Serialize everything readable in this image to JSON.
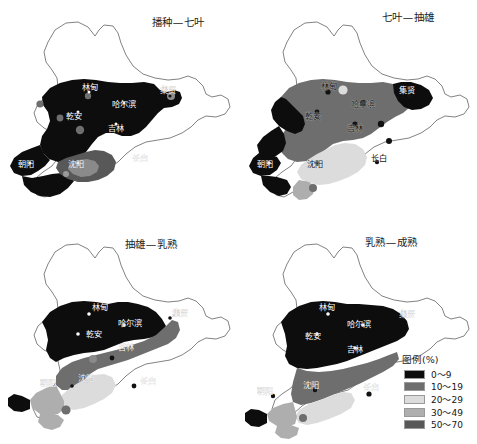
{
  "figure": {
    "kind": "choropleth-map-grid",
    "region": "Northeast China",
    "grid": "2x2"
  },
  "panels": [
    {
      "id": "panel-sowing-seven-leaf",
      "title": "播种—七叶",
      "position": "top-left",
      "labels": [
        "林甸",
        "集贤",
        "哈尔滨",
        "乾安",
        "吉林",
        "沈阳",
        "朝阳",
        "长白"
      ]
    },
    {
      "id": "panel-seven-leaf-tasseling",
      "title": "七叶—抽雄",
      "position": "top-right",
      "labels": [
        "林甸",
        "集贤",
        "哈尔滨",
        "乾安",
        "吉林",
        "沈阳",
        "朝阳",
        "长白"
      ]
    },
    {
      "id": "panel-tasseling-milk",
      "title": "抽雄—乳熟",
      "position": "bottom-left",
      "labels": [
        "林甸",
        "集贤",
        "哈尔滨",
        "乾安",
        "吉林",
        "沈阳",
        "朝阳",
        "长白"
      ]
    },
    {
      "id": "panel-milk-maturity",
      "title": "乳熟—成熟",
      "position": "bottom-right",
      "labels": [
        "林甸",
        "集贤",
        "哈尔滨",
        "乾安",
        "吉林",
        "沈阳",
        "朝阳",
        "长白"
      ]
    }
  ],
  "legend": {
    "title": "图例(%)",
    "items": [
      {
        "label": "0～9",
        "color": "#0d0d0d"
      },
      {
        "label": "10～19",
        "color": "#6e6e6e"
      },
      {
        "label": "20～29",
        "color": "#dcdcdc"
      },
      {
        "label": "30～49",
        "color": "#aeaeae"
      },
      {
        "label": "50～70",
        "color": "#585858"
      }
    ]
  },
  "city_points": [
    {
      "name": "林甸"
    },
    {
      "name": "集贤"
    },
    {
      "name": "哈尔滨"
    },
    {
      "name": "乾安"
    },
    {
      "name": "吉林"
    },
    {
      "name": "沈阳"
    },
    {
      "name": "朝阳"
    },
    {
      "name": "长白"
    }
  ],
  "colors": {
    "background": "#ffffff",
    "outline": "#6b6b6b",
    "class_0_9": "#0d0d0d",
    "class_10_19": "#6e6e6e",
    "class_20_29": "#dcdcdc",
    "class_30_49": "#aeaeae",
    "class_50_70": "#585858"
  }
}
